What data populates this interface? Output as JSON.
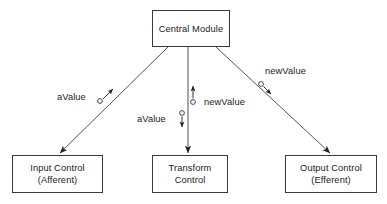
{
  "diagram": {
    "background_color": "#ffffff",
    "stroke_color": "#3a3a3a",
    "text_color": "#1a1a1a",
    "nodes": [
      {
        "id": "central-module",
        "label_line1": "Central Module",
        "label_line2": "",
        "x": 152,
        "y": 10,
        "w": 78,
        "h": 37
      },
      {
        "id": "input-control",
        "label_line1": "Input Control",
        "label_line2": "(Afferent)",
        "x": 12,
        "y": 155,
        "w": 91,
        "h": 38
      },
      {
        "id": "transform-control",
        "label_line1": "Transform",
        "label_line2": "Control",
        "x": 152,
        "y": 155,
        "w": 76,
        "h": 38
      },
      {
        "id": "output-control",
        "label_line1": "Output Control",
        "label_line2": "(Efferent)",
        "x": 285,
        "y": 155,
        "w": 92,
        "h": 38
      }
    ],
    "edges": [
      {
        "id": "edge-central-to-input",
        "from": "central-module",
        "to": "input-control",
        "x1": 168,
        "y1": 47,
        "x2": 60,
        "y2": 154
      },
      {
        "id": "edge-central-to-transform",
        "from": "central-module",
        "to": "transform-control",
        "x1": 188,
        "y1": 47,
        "x2": 188,
        "y2": 154
      },
      {
        "id": "edge-central-to-output",
        "from": "central-module",
        "to": "output-control",
        "x1": 216,
        "y1": 47,
        "x2": 330,
        "y2": 154
      }
    ],
    "flow_labels": [
      {
        "id": "flow-avalue-input",
        "text": "aValue",
        "direction": "up-right",
        "x": 57,
        "y": 92
      },
      {
        "id": "flow-newvalue-transform",
        "text": "newValue",
        "direction": "up",
        "x": 204,
        "y": 97
      },
      {
        "id": "flow-avalue-transform",
        "text": "aValue",
        "direction": "down",
        "x": 137,
        "y": 114
      },
      {
        "id": "flow-newvalue-output",
        "text": "newValue",
        "direction": "down-right",
        "x": 265,
        "y": 66
      }
    ]
  }
}
